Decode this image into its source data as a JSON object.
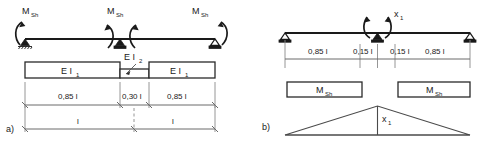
{
  "figure": {
    "panels": [
      {
        "key": "a",
        "tag": "a)",
        "moment_labels": [
          {
            "symbol": "M",
            "subscript": "Sh"
          },
          {
            "symbol": "M",
            "subscript": "Sh"
          },
          {
            "symbol": "M",
            "subscript": "Sh"
          }
        ],
        "stiffness_labels": [
          {
            "symbol": "E I",
            "subscript": "1"
          },
          {
            "symbol": "E I",
            "subscript": "2"
          },
          {
            "symbol": "E I",
            "subscript": "1"
          }
        ],
        "dimensions_upper": [
          "0,85 l",
          "0,30 l",
          "0,85 l"
        ],
        "dimensions_lower": [
          "l",
          "l"
        ]
      },
      {
        "key": "b",
        "tag": "b)",
        "redundant_label": {
          "symbol": "x",
          "subscript": "1"
        },
        "dimensions_upper": [
          "0,85 l",
          "0,15 l",
          "0,15 l",
          "0,85 l"
        ],
        "moment_blocks": [
          {
            "symbol": "M",
            "subscript": "Sh"
          },
          {
            "symbol": "M",
            "subscript": "Sh"
          }
        ],
        "influence_label": {
          "symbol": "x",
          "subscript": "1"
        }
      }
    ],
    "colors": {
      "line": "#1a1a1a",
      "dimension_line": "#6a6a6a",
      "box_outline": "#4a4a4a",
      "background": "#ffffff"
    }
  }
}
